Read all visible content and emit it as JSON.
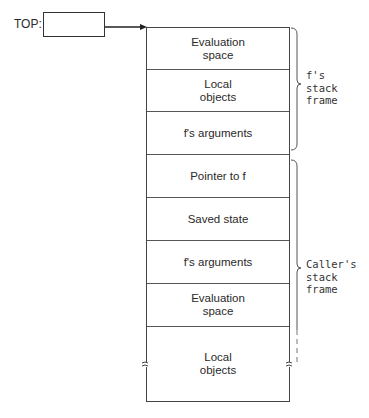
{
  "top_pointer": {
    "label": "TOP:"
  },
  "stack": {
    "cells": [
      {
        "label": "Evaluation\nspace",
        "top": 0,
        "height": 42
      },
      {
        "label": "Local\nobjects",
        "top": 42,
        "height": 42
      },
      {
        "label": "f's arguments",
        "top": 84,
        "height": 43
      },
      {
        "label": "Pointer to f",
        "top": 127,
        "height": 43
      },
      {
        "label": "Saved state",
        "top": 170,
        "height": 43
      },
      {
        "label": "f's arguments",
        "top": 213,
        "height": 43
      },
      {
        "label": "Evaluation\nspace",
        "top": 256,
        "height": 43
      },
      {
        "label": "Local\nobjects",
        "top": 299,
        "height": 76
      }
    ]
  },
  "braces": {
    "f_frame": {
      "label_line1": "f's",
      "label_line2": "stack",
      "label_line3": "frame"
    },
    "caller_frame": {
      "label_line1": "Caller's",
      "label_line2": "stack",
      "label_line3": "frame"
    }
  }
}
